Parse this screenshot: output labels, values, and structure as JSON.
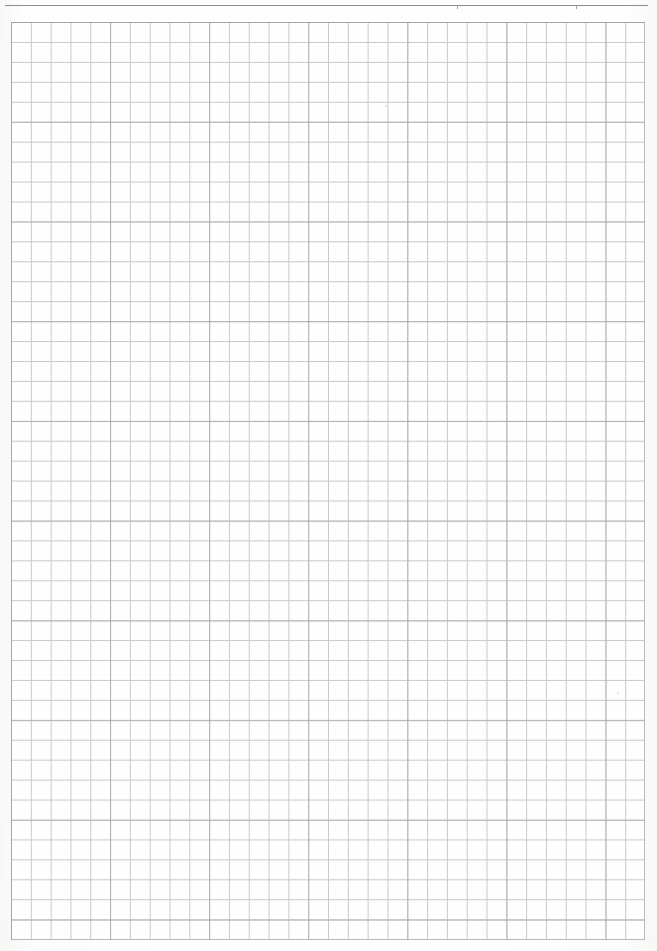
{
  "page": {
    "kind": "scanned-graph-paper",
    "width": 657,
    "height": 951,
    "background_color": "#fefefe",
    "paper_color": "#ffffff"
  },
  "header": {
    "title": "",
    "rule_color": "#8d8d8d",
    "ticks": [
      {
        "name": "header-rule-tick-left",
        "x": 457
      },
      {
        "name": "header-rule-tick-right",
        "x": 576
      }
    ]
  },
  "grid": {
    "left": 11,
    "top": 22,
    "width": 634,
    "height": 918,
    "columns": 32,
    "rows": 46,
    "cell_width": 19.82,
    "cell_height": 19.95,
    "accent_every": 5,
    "line_color": "#c9c9ce",
    "accent_line_color": "#96969e",
    "border_color": "#b9b9bf"
  },
  "marks": [
    {
      "name": "pencil-speck-upper",
      "x": 385,
      "y": 105,
      "size": 2.0
    },
    {
      "name": "pencil-speck-lower",
      "x": 617,
      "y": 692,
      "size": 2.2
    }
  ]
}
